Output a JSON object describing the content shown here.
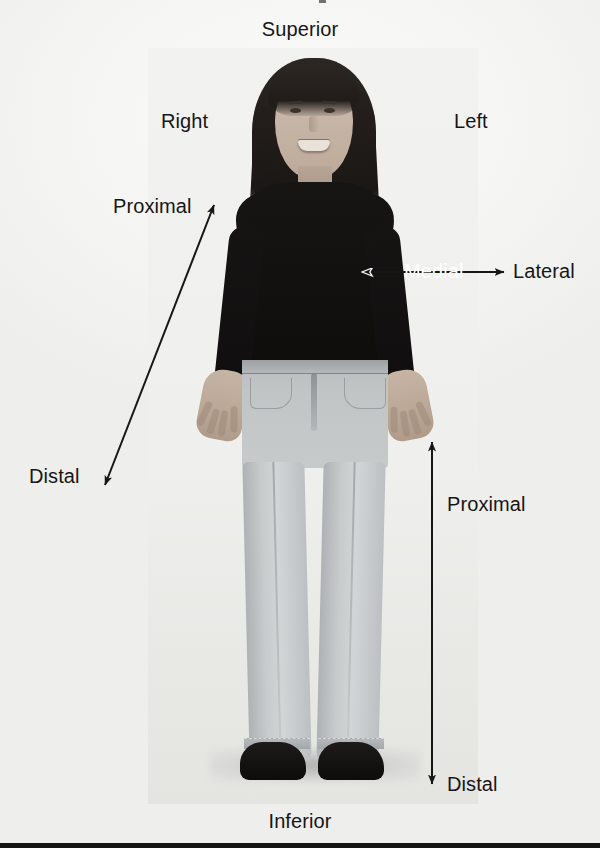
{
  "figure": {
    "subject_description": "Photograph of a woman standing in anatomical position, facing forward, wearing a dark long-sleeved top and light blue jeans with dark shoes",
    "background_color": "#f7f7f5",
    "text_color": "#161616",
    "white_text_color": "#ffffff",
    "rule_color": "#141414"
  },
  "labels": {
    "superior": "Superior",
    "inferior": "Inferior",
    "right": "Right",
    "left": "Left",
    "medial": "Medial",
    "lateral": "Lateral",
    "proximal_arm": "Proximal",
    "distal_arm": "Distal",
    "proximal_leg": "Proximal",
    "distal_leg": "Distal"
  },
  "arrows": [
    {
      "name": "arm-proximal-distal-arrow",
      "orientation": "diagonal",
      "heads": "double",
      "from_label": "Distal",
      "to_label": "Proximal",
      "color": "#161616"
    },
    {
      "name": "medial-lateral-arrow",
      "orientation": "horizontal",
      "heads": "double",
      "from_label": "Medial",
      "to_label": "Lateral",
      "color": "#161616",
      "left_head_style": "outlined-white"
    },
    {
      "name": "leg-proximal-distal-arrow",
      "orientation": "vertical",
      "heads": "double",
      "from_label": "Proximal",
      "to_label": "Distal",
      "color": "#161616"
    }
  ]
}
